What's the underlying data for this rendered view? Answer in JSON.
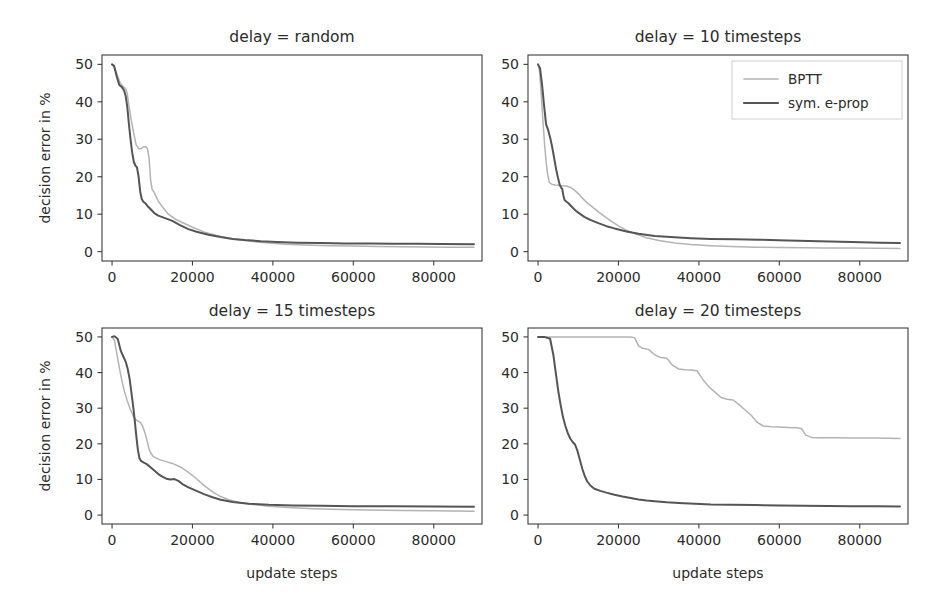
{
  "figure": {
    "width": 947,
    "height": 602,
    "background": "#ffffff",
    "layout": "2x2 grid of line plots"
  },
  "colors": {
    "bptt": "#b3b3b3",
    "eprop": "#555555",
    "axis": "#3c3c3c",
    "text": "#2b2b2b"
  },
  "legend": {
    "position": "upper right of top-right panel",
    "entries": [
      {
        "label": "BPTT",
        "color": "#b3b3b3"
      },
      {
        "label": "sym. e-prop",
        "color": "#555555"
      }
    ]
  },
  "axes_common": {
    "xlabel": "update steps",
    "ylabel": "decision error in %",
    "xticks": [
      0,
      20000,
      40000,
      60000,
      80000
    ],
    "xticklabels": [
      "0",
      "20000",
      "40000",
      "60000",
      "80000"
    ],
    "yticks": [
      0,
      10,
      20,
      30,
      40,
      50
    ],
    "yticklabels": [
      "0",
      "10",
      "20",
      "30",
      "40",
      "50"
    ],
    "xlim": [
      -2500,
      92000
    ],
    "ylim": [
      -2.5,
      52.5
    ],
    "grid": false
  },
  "chart_data": [
    {
      "type": "line",
      "title": "delay = random",
      "panel": "top-left",
      "xlabel": "",
      "ylabel": "decision error in %",
      "xlim": [
        -2500,
        92000
      ],
      "ylim": [
        -2.5,
        52.5
      ],
      "xticks": [
        0,
        20000,
        40000,
        60000,
        80000
      ],
      "yticks": [
        0,
        10,
        20,
        30,
        40,
        50
      ],
      "grid": false,
      "legend": false,
      "series": [
        {
          "name": "BPTT",
          "color": "#b3b3b3",
          "x": [
            0,
            500,
            1200,
            2000,
            2800,
            3400,
            3800,
            4200,
            4800,
            5400,
            6000,
            6600,
            7200,
            7800,
            8400,
            8800,
            9200,
            9600,
            10000,
            10400,
            10800,
            11500,
            12500,
            14000,
            16000,
            18000,
            20000,
            23000,
            26000,
            29000,
            32000,
            35000,
            39000,
            43000,
            48000,
            54000,
            60000,
            66000,
            72000,
            78000,
            84000,
            90000
          ],
          "y": [
            50.0,
            49.5,
            47.5,
            45.0,
            44.0,
            43.5,
            42.0,
            39.0,
            35.0,
            31.5,
            28.5,
            27.5,
            27.5,
            28.0,
            28.0,
            27.5,
            25.0,
            19.0,
            16.5,
            16.0,
            15.0,
            13.5,
            12.0,
            10.0,
            8.5,
            7.5,
            6.5,
            5.2,
            4.3,
            3.6,
            3.1,
            2.7,
            2.3,
            2.0,
            1.8,
            1.6,
            1.5,
            1.4,
            1.3,
            1.25,
            1.2,
            1.15
          ]
        },
        {
          "name": "sym. e-prop",
          "color": "#555555",
          "x": [
            0,
            500,
            1100,
            1800,
            2400,
            3000,
            3400,
            3800,
            4200,
            4600,
            5000,
            5400,
            5800,
            6200,
            6600,
            7000,
            7400,
            7800,
            8200,
            8800,
            9600,
            10500,
            11500,
            13000,
            15000,
            17000,
            19000,
            21000,
            24000,
            27000,
            30000,
            33000,
            37000,
            41000,
            46000,
            52000,
            58000,
            64000,
            70000,
            76000,
            82000,
            90000
          ],
          "y": [
            50.0,
            49.6,
            47.0,
            44.5,
            44.0,
            43.0,
            41.5,
            38.5,
            34.0,
            30.0,
            26.5,
            24.0,
            23.0,
            22.5,
            20.0,
            16.0,
            14.0,
            13.3,
            13.0,
            12.2,
            11.3,
            10.3,
            9.6,
            9.0,
            8.2,
            7.0,
            6.0,
            5.3,
            4.5,
            3.9,
            3.4,
            3.1,
            2.8,
            2.6,
            2.4,
            2.3,
            2.2,
            2.15,
            2.1,
            2.1,
            2.05,
            2.0
          ]
        }
      ]
    },
    {
      "type": "line",
      "title": "delay = 10 timesteps",
      "panel": "top-right",
      "xlabel": "",
      "ylabel": "",
      "xlim": [
        -2500,
        92000
      ],
      "ylim": [
        -2.5,
        52.5
      ],
      "xticks": [
        0,
        20000,
        40000,
        60000,
        80000
      ],
      "yticks": [
        0,
        10,
        20,
        30,
        40,
        50
      ],
      "grid": false,
      "legend": true,
      "series": [
        {
          "name": "BPTT",
          "color": "#b3b3b3",
          "x": [
            0,
            400,
            800,
            1200,
            1600,
            2000,
            2400,
            2800,
            3400,
            4200,
            5000,
            6000,
            7000,
            8000,
            9000,
            10000,
            11000,
            12500,
            14000,
            16000,
            18000,
            20000,
            22000,
            24000,
            27000,
            30000,
            34000,
            38000,
            43000,
            48000,
            54000,
            60000,
            66000,
            72000,
            78000,
            84000,
            90000
          ],
          "y": [
            50.0,
            48.0,
            42.0,
            35.0,
            29.0,
            24.0,
            20.5,
            18.5,
            18.0,
            17.8,
            17.7,
            17.6,
            17.5,
            17.2,
            16.5,
            15.5,
            14.3,
            12.8,
            11.5,
            9.8,
            8.3,
            6.9,
            5.7,
            4.8,
            3.7,
            3.0,
            2.3,
            1.9,
            1.6,
            1.4,
            1.2,
            1.1,
            1.05,
            1.0,
            0.95,
            0.9,
            0.85
          ]
        },
        {
          "name": "sym. e-prop",
          "color": "#555555",
          "x": [
            0,
            500,
            1000,
            1500,
            2000,
            2500,
            3000,
            3500,
            4000,
            4500,
            5000,
            5400,
            5800,
            6000,
            6300,
            6600,
            7000,
            7500,
            8200,
            9000,
            10000,
            11500,
            13000,
            15000,
            17000,
            19000,
            22000,
            25000,
            29000,
            33000,
            38000,
            43000,
            49000,
            55000,
            62000,
            70000,
            78000,
            85000,
            90000
          ],
          "y": [
            50.0,
            49.0,
            44.5,
            39.0,
            34.0,
            32.5,
            30.5,
            28.0,
            25.0,
            22.0,
            19.5,
            17.8,
            17.0,
            16.8,
            15.0,
            13.8,
            13.4,
            13.0,
            12.2,
            11.3,
            10.4,
            9.3,
            8.5,
            7.6,
            6.8,
            6.2,
            5.4,
            4.8,
            4.2,
            3.9,
            3.6,
            3.4,
            3.3,
            3.2,
            3.0,
            2.8,
            2.6,
            2.4,
            2.3
          ]
        }
      ]
    },
    {
      "type": "line",
      "title": "delay = 15 timesteps",
      "panel": "bottom-left",
      "xlabel": "update steps",
      "ylabel": "decision error in %",
      "xlim": [
        -2500,
        92000
      ],
      "ylim": [
        -2.5,
        52.5
      ],
      "xticks": [
        0,
        20000,
        40000,
        60000,
        80000
      ],
      "yticks": [
        0,
        10,
        20,
        30,
        40,
        50
      ],
      "grid": false,
      "legend": false,
      "series": [
        {
          "name": "BPTT",
          "color": "#b3b3b3",
          "x": [
            0,
            600,
            1400,
            2200,
            3000,
            3800,
            4600,
            5400,
            6200,
            7000,
            7600,
            8200,
            8800,
            9200,
            9600,
            10200,
            11000,
            12000,
            13500,
            15000,
            17000,
            19000,
            21000,
            23000,
            25000,
            27000,
            29000,
            32000,
            35000,
            39000,
            44000,
            50000,
            57000,
            64000,
            72000,
            80000,
            90000
          ],
          "y": [
            50.0,
            49.0,
            44.0,
            39.0,
            35.0,
            32.0,
            29.5,
            27.5,
            26.5,
            26.0,
            25.0,
            23.0,
            20.5,
            18.5,
            17.5,
            16.5,
            16.0,
            15.5,
            15.0,
            14.5,
            13.5,
            12.0,
            10.2,
            8.2,
            6.5,
            5.2,
            4.3,
            3.5,
            3.0,
            2.5,
            2.1,
            1.8,
            1.6,
            1.4,
            1.3,
            1.2,
            1.1
          ]
        },
        {
          "name": "sym. e-prop",
          "color": "#555555",
          "x": [
            0,
            600,
            1400,
            2200,
            2800,
            3400,
            3900,
            4400,
            4800,
            5200,
            5600,
            6000,
            6400,
            6800,
            7200,
            7800,
            8600,
            9500,
            10500,
            11500,
            12500,
            13500,
            14500,
            15500,
            16500,
            17500,
            19000,
            21000,
            23000,
            25000,
            27000,
            30000,
            34000,
            39000,
            45000,
            52000,
            60000,
            70000,
            80000,
            90000
          ],
          "y": [
            50.0,
            50.2,
            49.5,
            46.0,
            44.5,
            43.0,
            41.0,
            38.0,
            34.5,
            31.0,
            27.0,
            22.5,
            18.5,
            16.0,
            15.2,
            14.8,
            14.3,
            13.5,
            12.5,
            11.5,
            10.8,
            10.2,
            10.0,
            10.1,
            9.6,
            8.7,
            7.8,
            6.8,
            5.8,
            5.0,
            4.3,
            3.7,
            3.2,
            2.9,
            2.7,
            2.6,
            2.5,
            2.45,
            2.4,
            2.35
          ]
        }
      ]
    },
    {
      "type": "line",
      "title": "delay = 20 timesteps",
      "panel": "bottom-right",
      "xlabel": "update steps",
      "ylabel": "",
      "xlim": [
        -2500,
        92000
      ],
      "ylim": [
        -2.5,
        52.5
      ],
      "xticks": [
        0,
        20000,
        40000,
        60000,
        80000
      ],
      "yticks": [
        0,
        10,
        20,
        30,
        40,
        50
      ],
      "grid": false,
      "legend": false,
      "series": [
        {
          "name": "BPTT",
          "color": "#b3b3b3",
          "x": [
            0,
            2000,
            5000,
            10000,
            15000,
            20000,
            23000,
            24000,
            25000,
            26000,
            27500,
            29000,
            30500,
            32000,
            33500,
            35000,
            36500,
            38000,
            39500,
            41000,
            42500,
            44000,
            45500,
            47000,
            48500,
            50000,
            51500,
            53000,
            54500,
            56000,
            58000,
            60000,
            62000,
            64000,
            65500,
            66500,
            68000,
            70000,
            74000,
            78000,
            84000,
            90000
          ],
          "y": [
            50.0,
            50.0,
            50.0,
            50.0,
            50.0,
            50.0,
            50.0,
            49.8,
            47.5,
            46.8,
            46.5,
            45.0,
            44.2,
            44.0,
            42.0,
            41.0,
            40.8,
            40.7,
            40.5,
            38.0,
            36.0,
            34.5,
            33.0,
            32.5,
            32.3,
            31.0,
            29.5,
            28.0,
            26.0,
            25.0,
            24.8,
            24.7,
            24.6,
            24.5,
            24.3,
            22.5,
            21.8,
            21.7,
            21.7,
            21.6,
            21.6,
            21.5
          ]
        },
        {
          "name": "sym. e-prop",
          "color": "#555555",
          "x": [
            0,
            1500,
            3000,
            3800,
            4400,
            5000,
            5600,
            6200,
            6800,
            7400,
            8000,
            8600,
            9200,
            9800,
            10400,
            11000,
            11600,
            12200,
            13000,
            14000,
            15500,
            17000,
            19000,
            21000,
            23000,
            25000,
            27000,
            29000,
            32000,
            35000,
            39000,
            43000,
            48000,
            54000,
            60000,
            66000,
            72000,
            78000,
            84000,
            90000
          ],
          "y": [
            50.0,
            50.0,
            49.5,
            45.0,
            40.0,
            35.0,
            31.0,
            27.5,
            25.0,
            23.0,
            21.5,
            20.5,
            19.8,
            18.0,
            15.5,
            13.0,
            11.0,
            9.5,
            8.3,
            7.4,
            6.8,
            6.3,
            5.7,
            5.2,
            4.8,
            4.4,
            4.1,
            3.9,
            3.6,
            3.4,
            3.2,
            3.0,
            2.9,
            2.8,
            2.7,
            2.6,
            2.55,
            2.5,
            2.45,
            2.4
          ]
        }
      ]
    }
  ]
}
